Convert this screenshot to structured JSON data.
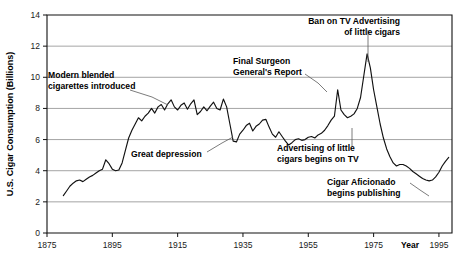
{
  "chart_data": {
    "type": "line",
    "title": "",
    "subtitle": "",
    "xlabel": "Year",
    "ylabel": "U.S. Cigar Consumption (Billions)",
    "xlim": [
      1875,
      1999
    ],
    "ylim": [
      0,
      14
    ],
    "grid": true,
    "legend": "none",
    "x_ticks": [
      "1875",
      "1895",
      "1915",
      "1935",
      "1955",
      "1975",
      "1995"
    ],
    "x_tick_values": [
      1875,
      1895,
      1915,
      1935,
      1955,
      1975,
      1995
    ],
    "y_ticks": [
      "0",
      "2",
      "4",
      "6",
      "8",
      "10",
      "12",
      "14"
    ],
    "y_tick_values": [
      0,
      2,
      4,
      6,
      8,
      10,
      12,
      14
    ],
    "series": [
      {
        "name": "U.S. Cigar Consumption",
        "color": "#111111",
        "x": [
          1880,
          1881,
          1882,
          1883,
          1884,
          1885,
          1886,
          1887,
          1888,
          1889,
          1890,
          1891,
          1892,
          1893,
          1894,
          1895,
          1896,
          1897,
          1898,
          1899,
          1900,
          1901,
          1902,
          1903,
          1904,
          1905,
          1906,
          1907,
          1908,
          1909,
          1910,
          1911,
          1912,
          1913,
          1914,
          1915,
          1916,
          1917,
          1918,
          1919,
          1920,
          1921,
          1922,
          1923,
          1924,
          1925,
          1926,
          1927,
          1928,
          1929,
          1930,
          1931,
          1932,
          1933,
          1934,
          1935,
          1936,
          1937,
          1938,
          1939,
          1940,
          1941,
          1942,
          1943,
          1944,
          1945,
          1946,
          1947,
          1948,
          1949,
          1950,
          1951,
          1952,
          1953,
          1954,
          1955,
          1956,
          1957,
          1958,
          1959,
          1960,
          1961,
          1962,
          1963,
          1964,
          1965,
          1966,
          1967,
          1968,
          1969,
          1970,
          1971,
          1972,
          1973,
          1974,
          1975,
          1976,
          1977,
          1978,
          1979,
          1980,
          1981,
          1982,
          1983,
          1984,
          1985,
          1986,
          1987,
          1988,
          1989,
          1990,
          1991,
          1992,
          1993,
          1994,
          1995,
          1996,
          1997,
          1998
        ],
        "values": [
          2.4,
          2.7,
          3.0,
          3.2,
          3.35,
          3.4,
          3.3,
          3.45,
          3.6,
          3.7,
          3.85,
          4.0,
          4.1,
          4.7,
          4.45,
          4.1,
          4.0,
          4.05,
          4.5,
          5.3,
          6.1,
          6.6,
          7.0,
          7.4,
          7.2,
          7.5,
          7.7,
          8.0,
          7.7,
          8.1,
          8.25,
          7.9,
          8.3,
          8.55,
          8.1,
          7.9,
          8.2,
          8.35,
          7.95,
          8.3,
          8.55,
          7.6,
          7.8,
          8.1,
          7.85,
          8.15,
          8.4,
          8.0,
          7.9,
          8.6,
          8.1,
          7.0,
          5.9,
          5.85,
          6.35,
          6.6,
          6.9,
          7.05,
          6.55,
          6.85,
          7.0,
          7.25,
          7.3,
          6.8,
          6.35,
          6.15,
          6.5,
          6.2,
          5.9,
          5.65,
          5.8,
          6.0,
          6.05,
          5.95,
          6.0,
          6.15,
          6.2,
          6.1,
          6.3,
          6.4,
          6.6,
          6.9,
          7.25,
          7.5,
          9.2,
          7.9,
          7.6,
          7.4,
          7.5,
          7.65,
          8.0,
          8.7,
          10.1,
          11.5,
          10.6,
          9.2,
          8.1,
          7.0,
          6.1,
          5.4,
          4.9,
          4.5,
          4.3,
          4.4,
          4.4,
          4.3,
          4.15,
          3.95,
          3.8,
          3.65,
          3.5,
          3.4,
          3.35,
          3.4,
          3.6,
          3.9,
          4.3,
          4.6,
          4.85
        ]
      }
    ],
    "annotations": [
      {
        "id": "modern-blended-cigarettes",
        "lines": [
          "Modern blended",
          "cigarettes introduced"
        ],
        "align": "left",
        "text_x": 48,
        "text_y": 78,
        "leader": "M 130 90 L 152 97 L 168 105"
      },
      {
        "id": "great-depression",
        "lines": [
          "Great depression"
        ],
        "align": "left",
        "text_x": 131,
        "text_y": 157,
        "leader": "M 207 152 L 222 143 L 233 137"
      },
      {
        "id": "final-surgeon-generals-report",
        "lines": [
          "Final Surgeon",
          "General's Report"
        ],
        "align": "left",
        "text_x": 233,
        "text_y": 64,
        "leader": "M 305 74 L 318 83 L 327 92"
      },
      {
        "id": "ban-on-tv-advertising",
        "lines": [
          "Ban on TV Advertising",
          "of little cigars"
        ],
        "align": "right",
        "text_x": 400,
        "text_y": 24,
        "leader": "M 368 30 L 368 62"
      },
      {
        "id": "advertising-little-cigars-tv",
        "lines": [
          "Advertising of little",
          "cigars begins on TV"
        ],
        "align": "left",
        "text_x": 277,
        "text_y": 151,
        "leader": "M 352 146 L 352 128"
      },
      {
        "id": "cigar-aficionado-begins-publishing",
        "lines": [
          "Cigar Aficionado",
          "begins publishing"
        ],
        "align": "left",
        "text_x": 327,
        "text_y": 185,
        "leader": "M 410 183 L 420 190 L 429 196"
      }
    ]
  },
  "axis": {
    "year_label": "Year",
    "y_axis_label": "U.S. Cigar Consumption (Billions)"
  },
  "colors": {
    "line": "#111111",
    "grid": "#8d8d8d",
    "frame": "#111111",
    "text": "#000000",
    "background": "#ffffff"
  }
}
